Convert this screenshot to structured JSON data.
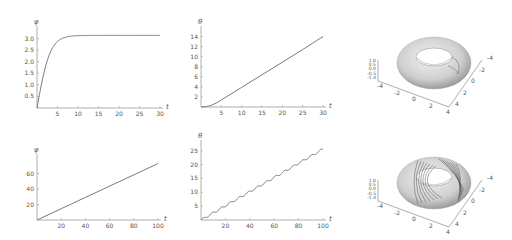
{
  "chart_data": [
    {
      "type": "line",
      "title": "",
      "xlabel": "t",
      "ylabel": "φ",
      "xlim": [
        0,
        30
      ],
      "ylim": [
        0,
        3.2
      ],
      "xticks": [
        "5",
        "10",
        "15",
        "20",
        "25",
        "30"
      ],
      "yticks": [
        "0.5",
        "1.0",
        "1.5",
        "2.0",
        "2.5",
        "3.0"
      ],
      "x": [
        0,
        1,
        2,
        3,
        4,
        5,
        6,
        7,
        8,
        10,
        15,
        20,
        25,
        30
      ],
      "values": [
        0,
        0.9,
        1.7,
        2.35,
        2.78,
        3.0,
        3.09,
        3.12,
        3.14,
        3.14,
        3.14,
        3.14,
        3.14,
        3.14
      ],
      "grid": false
    },
    {
      "type": "line",
      "title": "",
      "xlabel": "t",
      "ylabel": "θ",
      "xlim": [
        0,
        30
      ],
      "ylim": [
        0,
        14.5
      ],
      "xticks": [
        "5",
        "10",
        "15",
        "20",
        "25",
        "30"
      ],
      "yticks": [
        "2",
        "4",
        "6",
        "8",
        "10",
        "12",
        "14"
      ],
      "x": [
        0,
        1,
        2,
        3,
        4,
        5,
        10,
        15,
        20,
        25,
        30
      ],
      "values": [
        0,
        0.05,
        0.2,
        0.5,
        0.9,
        1.4,
        3.9,
        6.4,
        8.9,
        11.4,
        14.0
      ],
      "grid": false
    },
    {
      "type": "line",
      "title": "",
      "xlabel": "t",
      "ylabel": "φ",
      "xlim": [
        0,
        100
      ],
      "ylim": [
        0,
        75
      ],
      "xticks": [
        "20",
        "40",
        "60",
        "80",
        "100"
      ],
      "yticks": [
        "20",
        "40",
        "60"
      ],
      "x": [
        0,
        20,
        40,
        60,
        80,
        100
      ],
      "values": [
        0,
        14.6,
        29.2,
        43.8,
        58.4,
        73.0
      ],
      "grid": false
    },
    {
      "type": "line",
      "title": "",
      "xlabel": "t",
      "ylabel": "θ",
      "xlim": [
        0,
        100
      ],
      "ylim": [
        0,
        26
      ],
      "xticks": [
        "20",
        "40",
        "60",
        "80",
        "100"
      ],
      "yticks": [
        "5",
        "10",
        "15",
        "20",
        "25"
      ],
      "x": [
        0,
        20,
        40,
        60,
        80,
        100
      ],
      "values": [
        0,
        5.1,
        10.3,
        15.4,
        20.5,
        25.6
      ],
      "note": "nearly linear with small periodic wiggles",
      "grid": false
    },
    {
      "type": "surface3d",
      "title": "",
      "description": "torus surface with trajectory nearly closing around tube",
      "xticks": [
        "-4",
        "-2",
        "0",
        "2",
        "4"
      ],
      "yticks": [
        "-4",
        "-2",
        "0",
        "2",
        "4"
      ],
      "zticks": [
        "-1.0",
        "-0.5",
        "0.0",
        "0.5",
        "1.0"
      ]
    },
    {
      "type": "surface3d",
      "title": "",
      "description": "torus surface with many winding trajectory lines",
      "xticks": [
        "-4",
        "-2",
        "0",
        "2",
        "4"
      ],
      "yticks": [
        "-4",
        "-2",
        "0",
        "2",
        "4"
      ],
      "zticks": [
        "-1.0",
        "-0.5",
        "0.0",
        "0.5",
        "1.0"
      ]
    }
  ],
  "colors": {
    "curve": "#7a7a7a",
    "axis": "#9a9a9a",
    "text": "#555555",
    "torus_light": "#f2f2f2",
    "torus_dark": "#9c9c9c"
  }
}
